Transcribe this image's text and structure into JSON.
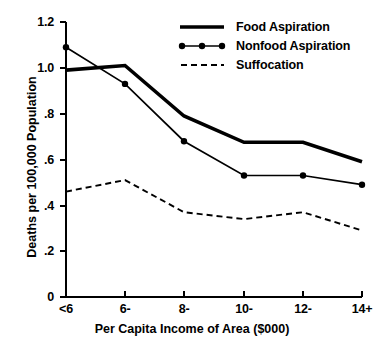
{
  "chart_data": {
    "type": "line",
    "title": "",
    "xlabel": "Per Capita Income of Area ($000)",
    "ylabel": "Deaths per 100,000 Population",
    "categories": [
      "<6",
      "6-",
      "8-",
      "10-",
      "12-",
      "14+"
    ],
    "ylim": [
      0,
      1.2
    ],
    "yticks": [
      0,
      0.2,
      0.4,
      0.6,
      0.8,
      1.0,
      1.2
    ],
    "ytick_labels": [
      "0",
      ".2",
      ".4",
      ".6",
      ".8",
      "1.0",
      "1.2"
    ],
    "grid": false,
    "legend_position": "top-right",
    "series": [
      {
        "name": "Food Aspiration",
        "style": "thick-solid",
        "markers": false,
        "values": [
          0.99,
          1.01,
          0.79,
          0.675,
          0.675,
          0.59
        ]
      },
      {
        "name": "Nonfood Aspiration",
        "style": "thin-solid",
        "markers": true,
        "values": [
          1.09,
          0.93,
          0.68,
          0.53,
          0.53,
          0.49
        ]
      },
      {
        "name": "Suffocation",
        "style": "dashed",
        "markers": false,
        "values": [
          0.46,
          0.51,
          0.37,
          0.34,
          0.37,
          0.29
        ]
      }
    ]
  },
  "axes": {
    "y_title": "Deaths per 100,000 Population",
    "x_title": "Per Capita Income of Area ($000)",
    "y_tick_labels": [
      "1.2",
      "1.0",
      ".8",
      ".6",
      ".4",
      ".2",
      "0"
    ],
    "x_tick_labels": [
      "<6",
      "6-",
      "8-",
      "10-",
      "12-",
      "14+"
    ]
  },
  "legend": {
    "items": [
      {
        "label": "Food Aspiration",
        "swatch": "thick-solid-line-swatch"
      },
      {
        "label": "Nonfood Aspiration",
        "swatch": "dotted-marker-line-swatch"
      },
      {
        "label": "Suffocation",
        "swatch": "dashed-line-swatch"
      }
    ]
  },
  "colors": {
    "ink": "#000000",
    "background": "#ffffff"
  }
}
